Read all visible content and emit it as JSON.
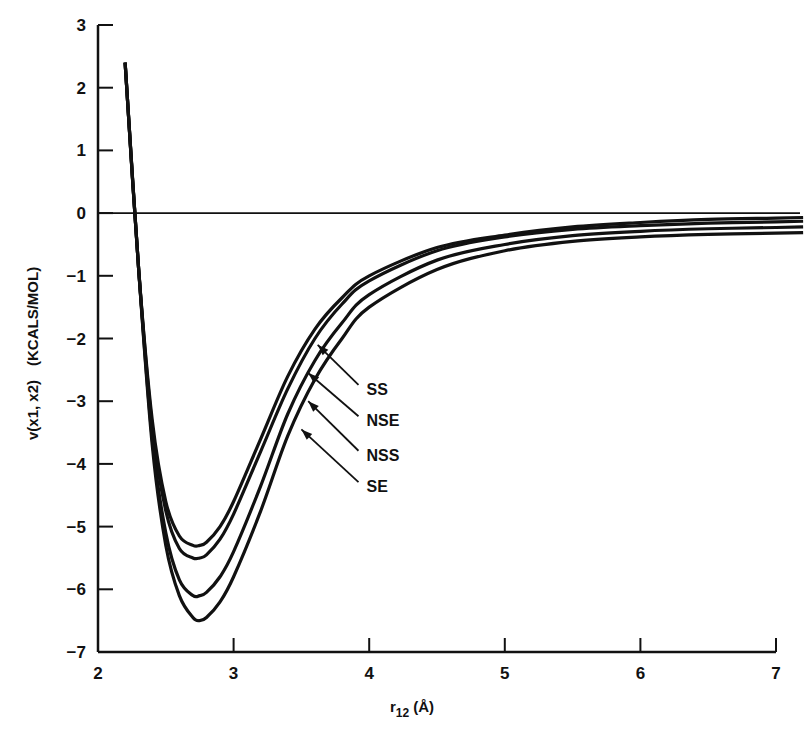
{
  "chart_data": {
    "type": "line",
    "title": "",
    "xlabel": "r12 (Å)",
    "xlabel_main": "r",
    "xlabel_sub": "12",
    "xlabel_unit": "(Å)",
    "ylabel": "v(x1, x2)  (KCALS/MOL)",
    "ylabel_func": "v(x1, x2)",
    "ylabel_unit": "(KCALS/MOL)",
    "xlim": [
      2,
      7
    ],
    "ylim": [
      -7,
      3
    ],
    "x_ticks": [
      "2",
      "3",
      "4",
      "5",
      "6",
      "7"
    ],
    "y_ticks": [
      "3",
      "2",
      "1",
      "0",
      "−1",
      "−2",
      "−3",
      "−4",
      "−5",
      "−6",
      "−7"
    ],
    "grid": false,
    "zero_line": true,
    "legend_position": "annotations with arrows, right of curves near r=3.6",
    "series": [
      {
        "name": "SS",
        "x": [
          2.2,
          2.3,
          2.4,
          2.5,
          2.6,
          2.7,
          2.75,
          2.8,
          2.9,
          3.0,
          3.2,
          3.4,
          3.6,
          3.8,
          4.0,
          4.5,
          5.0,
          5.5,
          6.0,
          6.5,
          7.0,
          7.2
        ],
        "values": [
          2.4,
          -0.9,
          -3.3,
          -4.6,
          -5.15,
          -5.3,
          -5.3,
          -5.25,
          -5.0,
          -4.6,
          -3.6,
          -2.6,
          -1.85,
          -1.35,
          -1.0,
          -0.55,
          -0.35,
          -0.22,
          -0.15,
          -0.1,
          -0.08,
          -0.07
        ]
      },
      {
        "name": "NSE",
        "x": [
          2.2,
          2.3,
          2.4,
          2.5,
          2.6,
          2.7,
          2.75,
          2.8,
          2.9,
          3.0,
          3.2,
          3.4,
          3.6,
          3.8,
          4.0,
          4.5,
          5.0,
          5.5,
          6.0,
          6.5,
          7.0,
          7.2
        ],
        "values": [
          2.4,
          -0.9,
          -3.4,
          -4.75,
          -5.35,
          -5.5,
          -5.5,
          -5.45,
          -5.2,
          -4.8,
          -3.8,
          -2.8,
          -2.0,
          -1.45,
          -1.08,
          -0.6,
          -0.38,
          -0.26,
          -0.2,
          -0.16,
          -0.14,
          -0.13
        ]
      },
      {
        "name": "NSS",
        "x": [
          2.2,
          2.3,
          2.4,
          2.5,
          2.6,
          2.7,
          2.75,
          2.8,
          2.9,
          3.0,
          3.2,
          3.4,
          3.6,
          3.8,
          4.0,
          4.5,
          5.0,
          5.5,
          6.0,
          6.5,
          7.0,
          7.2
        ],
        "values": [
          2.4,
          -0.9,
          -3.6,
          -5.1,
          -5.85,
          -6.1,
          -6.1,
          -6.05,
          -5.8,
          -5.4,
          -4.35,
          -3.2,
          -2.35,
          -1.75,
          -1.3,
          -0.75,
          -0.5,
          -0.36,
          -0.29,
          -0.25,
          -0.23,
          -0.22
        ]
      },
      {
        "name": "SE",
        "x": [
          2.2,
          2.3,
          2.4,
          2.5,
          2.6,
          2.7,
          2.75,
          2.8,
          2.9,
          3.0,
          3.2,
          3.4,
          3.6,
          3.8,
          4.0,
          4.5,
          5.0,
          5.5,
          6.0,
          6.5,
          7.0,
          7.2
        ],
        "values": [
          2.4,
          -0.9,
          -3.7,
          -5.3,
          -6.1,
          -6.45,
          -6.5,
          -6.45,
          -6.2,
          -5.8,
          -4.75,
          -3.55,
          -2.65,
          -2.0,
          -1.5,
          -0.9,
          -0.6,
          -0.45,
          -0.38,
          -0.34,
          -0.32,
          -0.31
        ]
      }
    ],
    "annotations": [
      {
        "label": "SS",
        "text_x": 3.98,
        "text_y": -2.9,
        "arrow_to_x": 3.62,
        "arrow_to_y": -2.1
      },
      {
        "label": "NSE",
        "text_x": 3.98,
        "text_y": -3.4,
        "arrow_to_x": 3.55,
        "arrow_to_y": -2.55
      },
      {
        "label": "NSS",
        "text_x": 3.98,
        "text_y": -3.95,
        "arrow_to_x": 3.55,
        "arrow_to_y": -3.0
      },
      {
        "label": "SE",
        "text_x": 3.98,
        "text_y": -4.45,
        "arrow_to_x": 3.5,
        "arrow_to_y": -3.45
      }
    ],
    "colors": {
      "line": "#111111",
      "background": "#ffffff"
    }
  }
}
